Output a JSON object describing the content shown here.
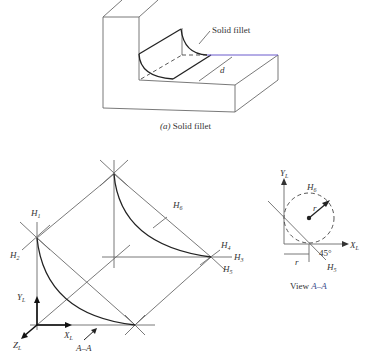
{
  "figure_a": {
    "callout": "Solid fillet",
    "dimension": "d",
    "caption_letter": "(a)",
    "caption_text": "Solid fillet"
  },
  "figure_b": {
    "points": {
      "h1": "H",
      "h1_sub": "1",
      "h2": "H",
      "h2_sub": "2",
      "h3": "H",
      "h3_sub": "3",
      "h4": "H",
      "h4_sub": "4",
      "h5": "H",
      "h5_sub": "5",
      "h6": "H",
      "h6_sub": "6"
    },
    "axes": {
      "y": "Y",
      "y_sub": "L",
      "x": "X",
      "x_sub": "L",
      "z": "Z",
      "z_sub": "L"
    },
    "view_arrow": "A–A"
  },
  "view_aa": {
    "y_axis": "Y",
    "y_sub": "L",
    "x_axis": "X",
    "x_sub": "L",
    "h6": "H",
    "h6_sub": "6",
    "h5": "H",
    "h5_sub": "5",
    "radius": "r",
    "offset": "r",
    "angle": "45°",
    "caption_prefix": "View ",
    "caption_view": "A–A"
  },
  "colors": {
    "line": "#6a6a6a",
    "outline": "#222222",
    "background": "#ffffff"
  }
}
